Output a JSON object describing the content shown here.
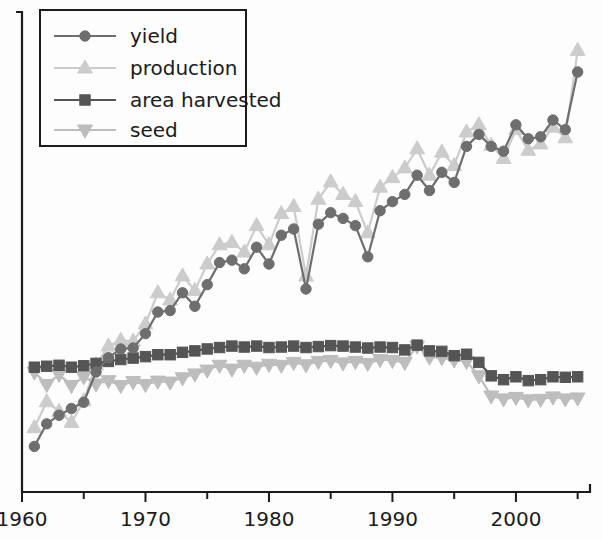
{
  "chart_data": {
    "type": "line",
    "title": "",
    "xlabel": "",
    "ylabel": "",
    "grid": false,
    "legend_position": "top-left",
    "xlim": [
      1960,
      2006
    ],
    "ylim": [
      0,
      100
    ],
    "x_ticks_major": [
      1960,
      1970,
      1980,
      1990,
      2000
    ],
    "x_ticks_minor": [
      1965,
      1975,
      1985,
      1995,
      2005
    ],
    "y_tick_labels": [],
    "x": [
      1961,
      1962,
      1963,
      1964,
      1965,
      1966,
      1967,
      1968,
      1969,
      1970,
      1971,
      1972,
      1973,
      1974,
      1975,
      1976,
      1977,
      1978,
      1979,
      1980,
      1981,
      1982,
      1983,
      1984,
      1985,
      1986,
      1987,
      1988,
      1989,
      1990,
      1991,
      1992,
      1993,
      1994,
      1995,
      1996,
      1997,
      1998,
      1999,
      2000,
      2001,
      2002,
      2003,
      2004,
      2005
    ],
    "series": [
      {
        "name": "yield",
        "marker": "circle",
        "color": "#6e6e6e",
        "values": [
          9.5,
          14.2,
          16.0,
          17.4,
          18.7,
          25.0,
          28.0,
          29.8,
          30.0,
          33.0,
          37.5,
          37.8,
          41.5,
          38.7,
          43.2,
          47.8,
          48.3,
          46.5,
          51.0,
          47.5,
          53.5,
          54.8,
          42.3,
          55.8,
          58.2,
          57.0,
          55.5,
          49.0,
          58.6,
          60.5,
          62.0,
          66.0,
          62.8,
          66.6,
          64.5,
          72.0,
          74.5,
          72.0,
          71.0,
          76.5,
          73.6,
          74.0,
          77.5,
          75.5,
          87.5
        ]
      },
      {
        "name": "production",
        "marker": "triangle-up",
        "color": "#cccccc",
        "values": [
          13.4,
          18.8,
          16.8,
          14.5,
          19.0,
          26.5,
          30.4,
          31.6,
          31.4,
          35.0,
          41.5,
          40.0,
          45.0,
          42.0,
          47.5,
          51.5,
          52.0,
          50.0,
          55.5,
          51.5,
          58.0,
          59.5,
          45.0,
          61.0,
          64.6,
          62.0,
          60.5,
          54.0,
          63.5,
          65.5,
          67.5,
          71.5,
          66.0,
          70.8,
          68.0,
          75.0,
          76.5,
          72.2,
          69.5,
          75.5,
          71.2,
          72.5,
          76.0,
          73.8,
          92.0
        ]
      },
      {
        "name": "area harvested",
        "marker": "square",
        "color": "#555555",
        "values": [
          26.0,
          26.2,
          26.4,
          26.0,
          26.3,
          26.8,
          27.2,
          27.6,
          27.9,
          28.2,
          28.6,
          28.6,
          29.1,
          29.4,
          29.8,
          30.1,
          30.4,
          30.2,
          30.4,
          30.1,
          30.2,
          30.4,
          30.1,
          30.3,
          30.5,
          30.4,
          30.2,
          30.0,
          30.2,
          30.1,
          29.6,
          30.6,
          29.4,
          29.3,
          28.4,
          28.7,
          27.0,
          24.2,
          23.4,
          24.0,
          23.2,
          23.4,
          24.0,
          23.9,
          24.0
        ]
      },
      {
        "name": "seed",
        "marker": "triangle-down",
        "color": "#bdbdbd",
        "values": [
          25.0,
          22.4,
          24.5,
          22.2,
          24.0,
          22.5,
          23.2,
          22.2,
          23.0,
          22.4,
          23.1,
          22.9,
          23.8,
          24.6,
          25.4,
          26.4,
          25.6,
          26.4,
          26.0,
          26.6,
          26.4,
          27.0,
          26.5,
          27.2,
          27.4,
          26.9,
          27.2,
          26.8,
          27.6,
          27.4,
          27.0,
          30.4,
          28.1,
          28.0,
          27.5,
          27.2,
          24.2,
          20.0,
          19.4,
          19.7,
          19.2,
          19.3,
          19.8,
          19.4,
          19.6
        ]
      }
    ]
  },
  "legend": {
    "items": [
      {
        "label": "yield"
      },
      {
        "label": "production"
      },
      {
        "label": "area harvested"
      },
      {
        "label": "seed"
      }
    ]
  },
  "axes": {
    "x_tick_labels": [
      "1960",
      "1970",
      "1980",
      "1990",
      "2000"
    ]
  }
}
